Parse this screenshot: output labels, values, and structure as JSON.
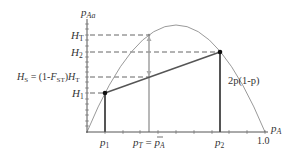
{
  "diagram": {
    "y_axis_label": "p",
    "y_axis_sub": "Aa",
    "x_axis_label": "p",
    "x_axis_sub": "A",
    "x_end_tick": "1.0",
    "curve_label": "2p(1-p)",
    "y_labels": {
      "HT": "H",
      "HT_sub": "T",
      "H2": "H",
      "H2_sub": "2",
      "HS_prefix": "H",
      "HS_sub": "S",
      "HS_eq": " = (1-",
      "HS_F": "F",
      "HS_F_sub": "ST",
      "HS_close": ")",
      "HS_H": "H",
      "HS_H_sub": "T",
      "H1": "H",
      "H1_sub": "1"
    },
    "x_labels": {
      "p1": "p",
      "p1_sub": "1",
      "pT": "p",
      "pT_sub": "T",
      "pT_eq": " = ",
      "pA_bar": "p",
      "pA_bar_sub": "A",
      "p2": "p",
      "p2_sub": "2"
    },
    "colors": {
      "axis": "#555555",
      "curve": "#9a9a9a",
      "line": "#555555",
      "dash": "#555555",
      "arrow": "#aaaaaa",
      "point": "#111111"
    }
  }
}
